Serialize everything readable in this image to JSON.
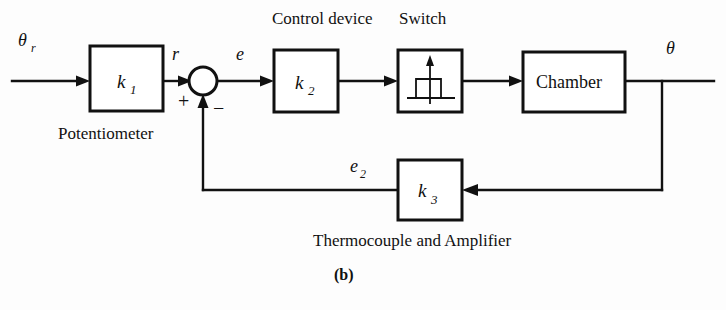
{
  "figure": {
    "label": "(b)",
    "type": "control-system-block-diagram",
    "background_color": "#fdfdfd",
    "line_color": "#111111"
  },
  "signals": {
    "input": "θ",
    "input_subscript": "r",
    "after_potentiometer": "r",
    "error": "e",
    "feedback": "e",
    "feedback_subscript": "2",
    "output": "θ"
  },
  "summing_junction": {
    "name": "summing-junction",
    "plus_sign": "+",
    "minus_sign": "−"
  },
  "blocks": [
    {
      "id": "potentiometer",
      "gain": "k",
      "gain_subscript": "1",
      "caption": "Potentiometer",
      "caption_position": "below"
    },
    {
      "id": "control-device",
      "gain": "k",
      "gain_subscript": "2",
      "caption": "Control device",
      "caption_position": "above"
    },
    {
      "id": "switch",
      "gain": "",
      "gain_subscript": "",
      "caption": "Switch",
      "caption_position": "above",
      "icon": "relay-step-response-icon"
    },
    {
      "id": "chamber",
      "text": "Chamber",
      "caption": "",
      "caption_position": "none"
    },
    {
      "id": "thermocouple-amplifier",
      "gain": "k",
      "gain_subscript": "3",
      "caption": "Thermocouple and Amplifier",
      "caption_position": "below"
    }
  ]
}
